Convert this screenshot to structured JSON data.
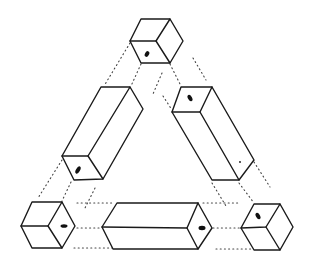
{
  "diagram": {
    "type": "impossible-triangle-of-blocks",
    "stroke_color": "#1a1a1a",
    "background": "#ffffff",
    "blocks": [
      {
        "name": "top-cube",
        "kind": "cube"
      },
      {
        "name": "left-prism",
        "kind": "rectangular-prism"
      },
      {
        "name": "right-prism",
        "kind": "rectangular-prism"
      },
      {
        "name": "bottom-left-cube",
        "kind": "cube"
      },
      {
        "name": "bottom-prism",
        "kind": "rectangular-prism"
      },
      {
        "name": "bottom-right-cube",
        "kind": "cube"
      }
    ],
    "connectors": "dotted construction lines between blocks"
  }
}
